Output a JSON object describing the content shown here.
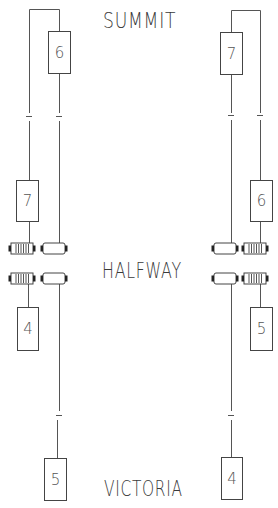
{
  "stations": {
    "top": "SUMMIT",
    "middle": "HALFWAY",
    "bottom": "VICTORIA"
  },
  "colors": {
    "line": "#555555",
    "box_border": "#444444",
    "text": "#3a3a3a",
    "background": "#ffffff"
  },
  "cars": {
    "left_top": "6",
    "left_mid": "7",
    "left_low": "4",
    "left_bottom": "5",
    "right_top": "7",
    "right_mid": "6",
    "right_low": "5",
    "right_bottom": "4"
  },
  "pulleys": {
    "left_upper": [
      "geared",
      "plain"
    ],
    "left_lower": [
      "geared",
      "plain"
    ],
    "right_upper": [
      "plain",
      "geared"
    ],
    "right_lower": [
      "plain",
      "geared"
    ]
  }
}
